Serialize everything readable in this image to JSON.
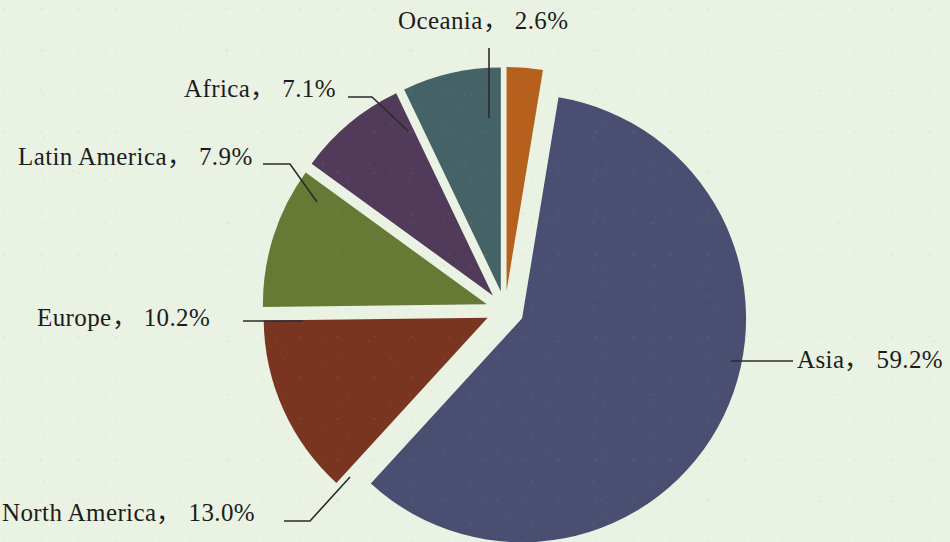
{
  "chart_data": {
    "type": "pie",
    "title": "",
    "subtitle": "",
    "xlabel": "",
    "ylabel": "",
    "legend_position": "none",
    "grid": false,
    "exploded": true,
    "value_unit": "%",
    "categories": [
      "Oceania",
      "Asia",
      "North America",
      "Europe",
      "Latin America",
      "Africa"
    ],
    "values": [
      2.6,
      59.2,
      13.0,
      10.2,
      7.9,
      7.1
    ],
    "labels": [
      "Oceania， 2.6%",
      "Asia， 59.2%",
      "North America， 13.0%",
      "Europe， 10.2%",
      "Latin America， 7.9%",
      "Africa， 7.1%"
    ],
    "slices": [
      {
        "name": "Oceania",
        "label": "Oceania， 2.6%",
        "value": 2.6,
        "color": "#b5601c"
      },
      {
        "name": "Asia",
        "label": "Asia， 59.2%",
        "value": 59.2,
        "color": "#4a4e70"
      },
      {
        "name": "North America",
        "label": "North America， 13.0%",
        "value": 13.0,
        "color": "#7a3521"
      },
      {
        "name": "Europe",
        "label": "Europe， 10.2%",
        "value": 10.2,
        "color": "#667a35"
      },
      {
        "name": "Latin America",
        "label": "Latin America， 7.9%",
        "value": 7.9,
        "color": "#523a5a"
      },
      {
        "name": "Africa",
        "label": "Africa， 7.1%",
        "value": 7.1,
        "color": "#456266"
      }
    ],
    "colors": {
      "background": "#eaf2e4",
      "oceania": "#b5601c",
      "asia": "#4a4e70",
      "north_america": "#7a3521",
      "europe": "#667a35",
      "latin_america": "#523a5a",
      "africa": "#456266",
      "leader_line": "#2b2b2b",
      "text": "#1c1c1c"
    }
  }
}
